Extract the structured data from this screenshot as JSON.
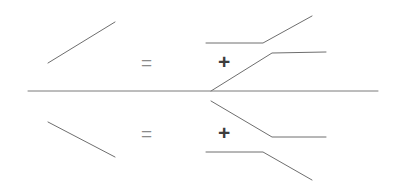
{
  "figure": {
    "background_color": "#ffffff",
    "width": 396,
    "height": 195,
    "stroke_color": "#6e6e6e",
    "axis_color": "#7a7a7a",
    "stroke_width": 1
  },
  "operators": {
    "equals_top": "=",
    "plus_top": "+",
    "equals_bottom": "=",
    "plus_bottom": "+",
    "equals_color": "#8a8a8a",
    "plus_color": "#3d3d3d"
  },
  "chart_data": {
    "type": "line",
    "xlabel": "",
    "ylabel": "",
    "xlim": [
      0,
      396
    ],
    "ylim": [
      195,
      0
    ],
    "grid": false,
    "legend": null,
    "vertex": {
      "x": 211,
      "y": 91
    },
    "series": [
      {
        "name": "lhs-upper-slope",
        "role": "left-hand-side",
        "half": "upper",
        "points": [
          [
            48,
            63
          ],
          [
            115,
            22
          ]
        ]
      },
      {
        "name": "rhs-upper-term1-kink",
        "role": "right-hand-side-term-1",
        "half": "upper",
        "points": [
          [
            206,
            43
          ],
          [
            263,
            43
          ],
          [
            312,
            16
          ]
        ]
      },
      {
        "name": "rhs-upper-term2-kink",
        "role": "right-hand-side-term-2",
        "half": "upper",
        "points": [
          [
            211,
            91
          ],
          [
            272,
            53
          ],
          [
            326,
            52
          ]
        ]
      },
      {
        "name": "baseline-axis",
        "role": "axis",
        "half": "center",
        "points": [
          [
            28,
            91
          ],
          [
            378,
            91
          ]
        ]
      },
      {
        "name": "lhs-lower-slope",
        "role": "left-hand-side",
        "half": "lower",
        "points": [
          [
            48,
            122
          ],
          [
            115,
            157
          ]
        ]
      },
      {
        "name": "rhs-lower-term1-kink",
        "role": "right-hand-side-term-1",
        "half": "lower",
        "points": [
          [
            211,
            101
          ],
          [
            272,
            137
          ],
          [
            326,
            137
          ]
        ]
      },
      {
        "name": "rhs-lower-term2-kink",
        "role": "right-hand-side-term-2",
        "half": "lower",
        "points": [
          [
            206,
            152
          ],
          [
            263,
            152
          ],
          [
            312,
            180
          ]
        ]
      }
    ]
  }
}
